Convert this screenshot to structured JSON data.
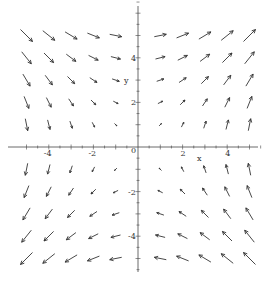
{
  "chart_data": {
    "type": "vector_field",
    "title": "",
    "field": "F(x, y) = (y, x)",
    "xlabel": "x",
    "ylabel": "y",
    "xlim": [
      -5.2,
      5.6
    ],
    "ylim": [
      -5.6,
      6.5
    ],
    "x_ticks": [
      -4,
      -2,
      0,
      2,
      4
    ],
    "y_ticks": [
      -4,
      -2,
      2,
      4
    ],
    "x_tick_labels": [
      "-4",
      "-2",
      "0",
      "2",
      "4"
    ],
    "y_tick_labels": [
      "-4",
      "-2",
      "2",
      "4"
    ],
    "grid": false,
    "grid_x": [
      -5,
      -4,
      -3,
      -2,
      -1,
      1,
      2,
      3,
      4,
      5
    ],
    "grid_y": [
      -5,
      -4,
      -3,
      -2,
      -1,
      1,
      2,
      3,
      4,
      5
    ],
    "arrow_color": "#333333",
    "axis_color": "#444444"
  },
  "axes": {
    "origin_label": "0",
    "x_label": "x",
    "y_label": "y"
  }
}
